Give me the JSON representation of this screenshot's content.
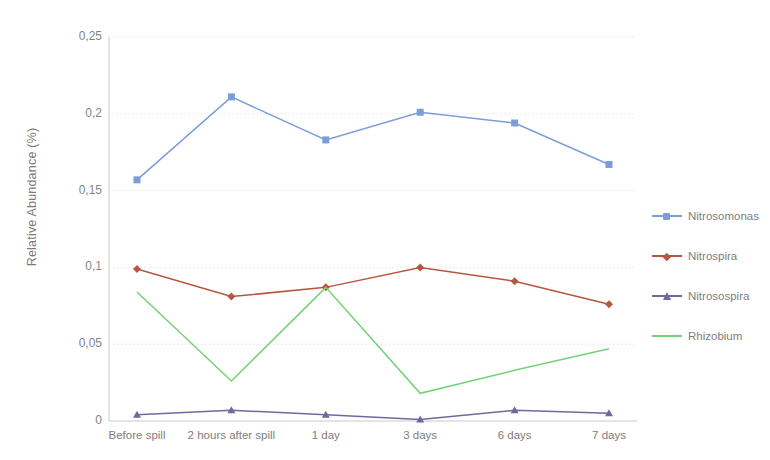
{
  "chart_data": {
    "type": "line",
    "title": "",
    "xlabel": "",
    "ylabel": "Relative Abundance (%)",
    "categories": [
      "Before spill",
      "2 hours after spill",
      "1 day",
      "3 days",
      "6 days",
      "7 days"
    ],
    "ylim": [
      0,
      0.25
    ],
    "ytick_labels": [
      "0,25",
      "0,2",
      "0,15",
      "0,1",
      "0,05",
      "0"
    ],
    "ytick_values": [
      0.25,
      0.2,
      0.15,
      0.1,
      0.05,
      0
    ],
    "grid": "horizontal-dotted",
    "legend_position": "right",
    "decimal_separator": ",",
    "series": [
      {
        "name": "Nitrosomonas",
        "color": "#7b9ed9",
        "marker": "square",
        "values": [
          0.157,
          0.211,
          0.183,
          0.201,
          0.194,
          0.167
        ]
      },
      {
        "name": "Nitrospira",
        "color": "#b7553f",
        "marker": "diamond",
        "values": [
          0.099,
          0.081,
          0.087,
          0.1,
          0.091,
          0.076
        ]
      },
      {
        "name": "Nitrosospira",
        "color": "#6c6a9e",
        "marker": "triangle",
        "values": [
          0.004,
          0.007,
          0.004,
          0.001,
          0.007,
          0.005
        ]
      },
      {
        "name": "Rhizobium",
        "color": "#76d179",
        "marker": "none",
        "values": [
          0.084,
          0.026,
          0.087,
          0.018,
          0.033,
          0.047
        ]
      }
    ]
  },
  "axis": {
    "y_title": "Relative Abundance (%)"
  }
}
